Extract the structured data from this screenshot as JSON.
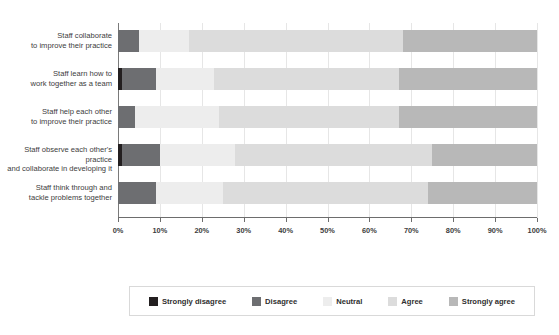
{
  "title": "",
  "chart_data": {
    "type": "bar",
    "orientation": "horizontal",
    "stacked": true,
    "stack_unit": "percent",
    "title": "",
    "xlabel": "",
    "ylabel": "",
    "xlim": [
      0,
      100
    ],
    "xticks": [
      "0%",
      "10%",
      "20%",
      "30%",
      "40%",
      "50%",
      "60%",
      "70%",
      "80%",
      "90%",
      "100%"
    ],
    "grid": true,
    "legend_position": "bottom",
    "categories": [
      "Staff collaborate to improve their practice",
      "Staff learn how to work together as a team",
      "Staff help each other to improve their practice",
      "Staff observe each other's practice and collaborate in developing it",
      "Staff think through and tackle problems together"
    ],
    "category_lines": [
      [
        "Staff collaborate",
        "to improve their practice"
      ],
      [
        "Staff learn how to",
        "work together as a team"
      ],
      [
        "Staff help each other",
        "to improve their practice"
      ],
      [
        "Staff observe each other's practice",
        "and collaborate in developing it"
      ],
      [
        "Staff think through and",
        "tackle problems together"
      ]
    ],
    "series": [
      {
        "name": "Strongly disagree",
        "color": "#231f20",
        "values": [
          0,
          1,
          0,
          1,
          0
        ]
      },
      {
        "name": "Disagree",
        "color": "#6d6e71",
        "values": [
          5,
          8,
          4,
          9,
          9
        ]
      },
      {
        "name": "Neutral",
        "color": "#ededed",
        "values": [
          12,
          14,
          20,
          18,
          16
        ]
      },
      {
        "name": "Agree",
        "color": "#dcdcdc",
        "values": [
          51,
          44,
          43,
          47,
          49
        ]
      },
      {
        "name": "Strongly agree",
        "color": "#b8b8b8",
        "values": [
          32,
          33,
          33,
          25,
          26
        ]
      }
    ]
  },
  "legend": {
    "items": [
      {
        "label": "Strongly disagree",
        "color": "#231f20"
      },
      {
        "label": "Disagree",
        "color": "#6d6e71"
      },
      {
        "label": "Neutral",
        "color": "#ededed"
      },
      {
        "label": "Agree",
        "color": "#dcdcdc"
      },
      {
        "label": "Strongly agree",
        "color": "#b8b8b8"
      }
    ]
  }
}
